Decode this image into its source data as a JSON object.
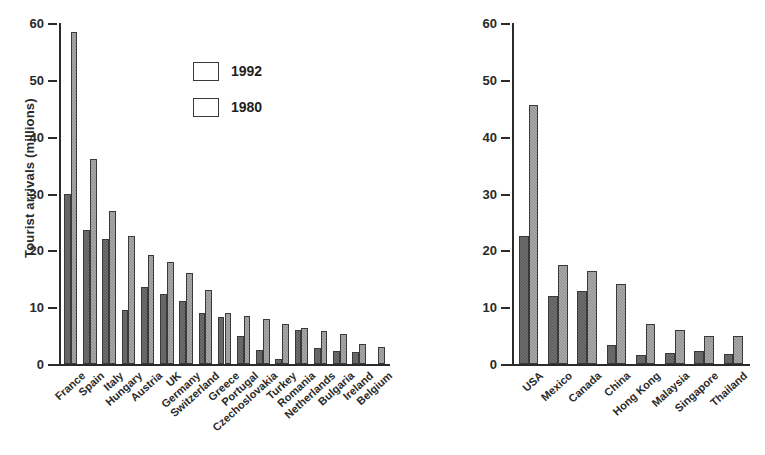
{
  "chart_data": [
    {
      "type": "bar",
      "id": "europe",
      "title": "",
      "xlabel": "",
      "ylabel": "Tourist arrivals (millions)",
      "ylim": [
        0,
        60
      ],
      "yticks": [
        0,
        10,
        20,
        30,
        40,
        50,
        60
      ],
      "ytick_labels": [
        "0",
        "10",
        "20",
        "30",
        "40",
        "50",
        "60"
      ],
      "grid": false,
      "legend_position": "upper center",
      "categories": [
        "France",
        "Spain",
        "Italy",
        "Hungary",
        "Austria",
        "UK",
        "Germany",
        "Switzerland",
        "Greece",
        "Portugal",
        "Czechoslovakia",
        "Turkey",
        "Romania",
        "Netherlands",
        "Bulgaria",
        "Ireland",
        "Belgium"
      ],
      "series": [
        {
          "name": "1980",
          "color": "#595959",
          "values": [
            30.0,
            23.5,
            22.0,
            9.5,
            13.6,
            12.3,
            11.0,
            8.9,
            8.2,
            4.9,
            2.5,
            0.8,
            6.0,
            2.8,
            2.3,
            2.2,
            0.0
          ]
        },
        {
          "name": "1992",
          "color": "#8f8f8f",
          "values": [
            58.5,
            36.0,
            27.0,
            22.5,
            19.1,
            18.0,
            16.0,
            13.0,
            9.0,
            8.5,
            8.0,
            7.0,
            6.3,
            5.8,
            5.3,
            3.5,
            3.0
          ]
        }
      ]
    },
    {
      "type": "bar",
      "id": "americas-asia",
      "title": "",
      "xlabel": "",
      "ylabel": "",
      "ylim": [
        0,
        60
      ],
      "yticks": [
        0,
        10,
        20,
        30,
        40,
        50,
        60
      ],
      "ytick_labels": [
        "0",
        "10",
        "20",
        "30",
        "40",
        "50",
        "60"
      ],
      "grid": false,
      "legend_position": "none",
      "categories": [
        "USA",
        "Mexico",
        "Canada",
        "China",
        "Hong Kong",
        "Malaysia",
        "Singapore",
        "Thailand"
      ],
      "series": [
        {
          "name": "1980",
          "color": "#595959",
          "values": [
            22.5,
            12.0,
            12.8,
            3.3,
            1.5,
            2.0,
            2.3,
            1.7
          ]
        },
        {
          "name": "1992",
          "color": "#8f8f8f",
          "values": [
            45.5,
            17.5,
            16.3,
            14.0,
            7.0,
            6.0,
            5.0,
            5.0
          ]
        }
      ]
    }
  ],
  "legend": {
    "items": [
      {
        "label": "1992",
        "series": "1992"
      },
      {
        "label": "1980",
        "series": "1980"
      }
    ]
  },
  "colors": {
    "series_1992": "#8f8f8f",
    "series_1980": "#595959",
    "axis": "#2b2b2b",
    "text": "#2a2a2a",
    "background": "#ffffff"
  }
}
